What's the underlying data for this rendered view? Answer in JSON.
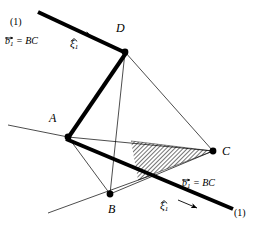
{
  "figure": {
    "name": "tetrahedron-screw-axis-diagram",
    "background_color": "#ffffff",
    "ink_color": "#000000",
    "hatch_color": "#000000",
    "width": 253,
    "height": 230
  },
  "vertices": [
    {
      "id": "A",
      "label": "A",
      "x": 68,
      "y": 137
    },
    {
      "id": "B",
      "label": "B",
      "x": 110,
      "y": 194
    },
    {
      "id": "C",
      "label": "C",
      "x": 213,
      "y": 151
    },
    {
      "id": "D",
      "label": "D",
      "x": 125,
      "y": 52
    }
  ],
  "vertex_labels": [
    {
      "text": "D",
      "x": 116,
      "y": 28
    },
    {
      "text": "A",
      "x": 50,
      "y": 118
    },
    {
      "text": "C",
      "x": 222,
      "y": 143
    },
    {
      "text": "B",
      "x": 110,
      "y": 202
    }
  ],
  "annotations": {
    "top": {
      "line_id": "(1)",
      "equation_b": "b",
      "equation_sub": "1",
      "equation_rest": "= BC",
      "xi_symbol": "ξ",
      "xi_sub": "1"
    },
    "bottom": {
      "line_id": "(1)",
      "equation_b": "b",
      "equation_sub": "1",
      "equation_rest": "= BC",
      "xi_symbol": "ξ",
      "xi_sub": "1"
    }
  },
  "geometry": {
    "thick_bar_upper": {
      "x1": 38,
      "y1": 12,
      "x2": 125,
      "y2": 52,
      "width": 4
    },
    "thick_bar_AD": {
      "x1": 68,
      "y1": 137,
      "x2": 125,
      "y2": 52,
      "width": 4
    },
    "thick_bar_lower": {
      "x1": 66,
      "y1": 139,
      "x2": 233,
      "y2": 209,
      "width": 4
    },
    "thin_edges": [
      {
        "from": "A",
        "to": "C"
      },
      {
        "from": "A",
        "to": "B"
      },
      {
        "from": "D",
        "to": "B"
      },
      {
        "from": "D",
        "to": "C"
      },
      {
        "from": "B",
        "to": "C"
      }
    ],
    "thin_extension_left": {
      "x1": 8,
      "y1": 125,
      "x2": 68,
      "y2": 137
    },
    "thin_extension_bottom_left": {
      "x1": 48,
      "y1": 213,
      "x2": 153,
      "y2": 175
    },
    "hatched_wedge": {
      "apex_x": 213,
      "apex_y": 151,
      "p1_x": 131,
      "p1_y": 141,
      "p2_x": 138,
      "p2_y": 180,
      "hatch_angle_deg": 45,
      "hatch_spacing": 3
    },
    "arrow_top": {
      "x1": 73,
      "y1": 29,
      "x2": 93,
      "y2": 37
    },
    "arrow_bottom": {
      "x1": 178,
      "y1": 201,
      "x2": 199,
      "y2": 208
    }
  }
}
